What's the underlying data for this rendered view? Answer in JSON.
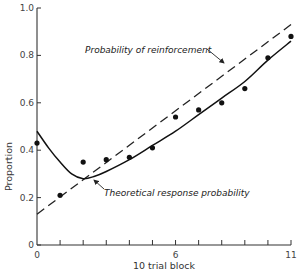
{
  "chart_data": {
    "type": "line",
    "title": "",
    "xlabel": "10 trial block",
    "ylabel": "Proportion",
    "xlim": [
      0,
      11
    ],
    "ylim": [
      0,
      1.0
    ],
    "grid": false,
    "x_ticks": [
      0,
      1,
      2,
      3,
      4,
      5,
      6,
      7,
      8,
      9,
      10,
      11
    ],
    "x_tick_labels": [
      {
        "x": 0,
        "label": "0"
      },
      {
        "x": 6,
        "label": "6"
      },
      {
        "x": 11,
        "label": "11"
      }
    ],
    "y_ticks": [
      0,
      0.2,
      0.4,
      0.6,
      0.8,
      1.0
    ],
    "y_tick_labels": [
      "0",
      "0.2",
      "0.4",
      "0.6",
      "0.8",
      "1.0"
    ],
    "series": [
      {
        "name": "Probability of reinforcement",
        "style": "dashed",
        "x": [
          0,
          11
        ],
        "values": [
          0.13,
          0.93
        ]
      },
      {
        "name": "Theoretical response probability",
        "style": "solid",
        "x": [
          0,
          0.5,
          1,
          1.5,
          2,
          2.5,
          3,
          4,
          5,
          6,
          7,
          8,
          9,
          10,
          11
        ],
        "values": [
          0.48,
          0.41,
          0.35,
          0.3,
          0.28,
          0.29,
          0.31,
          0.36,
          0.42,
          0.48,
          0.55,
          0.62,
          0.69,
          0.78,
          0.86
        ]
      },
      {
        "name": "Observed proportions",
        "style": "points",
        "x": [
          0,
          1,
          2,
          3,
          4,
          5,
          6,
          7,
          8,
          9,
          10,
          11
        ],
        "values": [
          0.43,
          0.21,
          0.35,
          0.36,
          0.37,
          0.41,
          0.54,
          0.57,
          0.6,
          0.66,
          0.79,
          0.88
        ]
      }
    ],
    "annotations": [
      {
        "text": "Probability of reinforcement",
        "points_to": "dashed line near block 8"
      },
      {
        "text": "Theoretical response probability",
        "points_to": "solid curve near block 2.3"
      }
    ]
  }
}
